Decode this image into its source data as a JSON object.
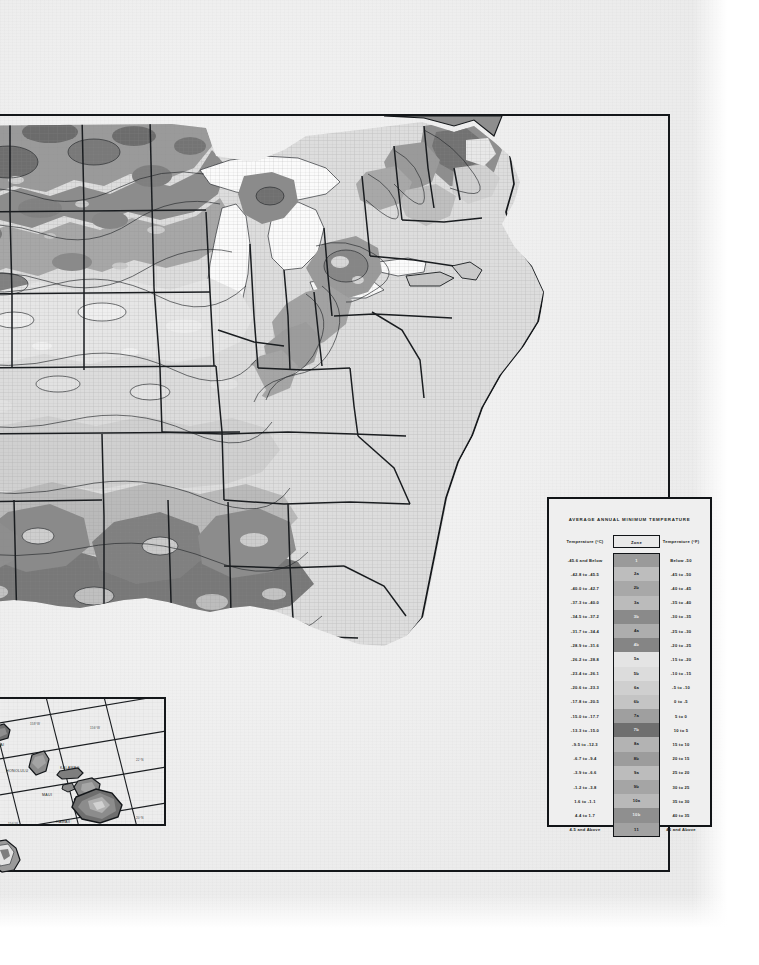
{
  "document": {
    "kind": "scanned-map-page",
    "map_title": "USDA Plant Hardiness Zone Map",
    "paper_color": "#f2f2f2",
    "ink_color": "#14171a"
  },
  "legend": {
    "title": "AVERAGE ANNUAL MINIMUM TEMPERATURE",
    "columns": {
      "celsius": "Temperature (°C)",
      "zone": "Zone",
      "fahrenheit": "Temperature (°F)"
    },
    "rows": [
      {
        "celsius": "-45.6  and Below",
        "zone": "1",
        "fahrenheit": "Below  -50",
        "swatch": "#9a9a9a",
        "dark": true
      },
      {
        "celsius": "-42.8  to  -45.5",
        "zone": "2a",
        "fahrenheit": "-45  to  -50",
        "swatch": "#bdbdbd",
        "dark": false
      },
      {
        "celsius": "-40.0  to  -42.7",
        "zone": "2b",
        "fahrenheit": "-40  to  -45",
        "swatch": "#a8a8a8",
        "dark": false
      },
      {
        "celsius": "-37.3  to  -40.0",
        "zone": "3a",
        "fahrenheit": "-35  to  -40",
        "swatch": "#bbbbbb",
        "dark": false
      },
      {
        "celsius": "-34.5  to  -37.2",
        "zone": "3b",
        "fahrenheit": "-30  to  -35",
        "swatch": "#8a8a8a",
        "dark": true
      },
      {
        "celsius": "-31.7  to  -34.4",
        "zone": "4a",
        "fahrenheit": "-25  to  -30",
        "swatch": "#adadad",
        "dark": false
      },
      {
        "celsius": "-28.9  to  -31.6",
        "zone": "4b",
        "fahrenheit": "-20  to  -25",
        "swatch": "#858585",
        "dark": true
      },
      {
        "celsius": "-26.2  to  -28.8",
        "zone": "5a",
        "fahrenheit": "-15  to  -20",
        "swatch": "#e4e4e4",
        "dark": false
      },
      {
        "celsius": "-23.4  to  -26.1",
        "zone": "5b",
        "fahrenheit": "-10  to  -15",
        "swatch": "#dcdcdc",
        "dark": false
      },
      {
        "celsius": "-20.6  to  -23.3",
        "zone": "6a",
        "fahrenheit": "-5  to  -10",
        "swatch": "#cfcfcf",
        "dark": false
      },
      {
        "celsius": "-17.8  to  -20.5",
        "zone": "6b",
        "fahrenheit": "0  to  -5",
        "swatch": "#c4c4c4",
        "dark": false
      },
      {
        "celsius": "-15.0  to  -17.7",
        "zone": "7a",
        "fahrenheit": "5  to  0",
        "swatch": "#9f9f9f",
        "dark": false
      },
      {
        "celsius": "-13.3  to  -15.0",
        "zone": "7b",
        "fahrenheit": "10  to  5",
        "swatch": "#6f6f6f",
        "dark": true
      },
      {
        "celsius": "-9.5  to  -12.3",
        "zone": "8a",
        "fahrenheit": "15  to  10",
        "swatch": "#b3b3b3",
        "dark": false
      },
      {
        "celsius": "-6.7  to  -9.4",
        "zone": "8b",
        "fahrenheit": "20  to  15",
        "swatch": "#9c9c9c",
        "dark": false
      },
      {
        "celsius": "-3.9  to  -6.6",
        "zone": "9a",
        "fahrenheit": "25  to  20",
        "swatch": "#bcbcbc",
        "dark": false
      },
      {
        "celsius": "-1.2  to  -3.8",
        "zone": "9b",
        "fahrenheit": "30  to  25",
        "swatch": "#a5a5a5",
        "dark": false
      },
      {
        "celsius": "1.6  to  -1.1",
        "zone": "10a",
        "fahrenheit": "35  to  30",
        "swatch": "#b9b9b9",
        "dark": false
      },
      {
        "celsius": "4.4  to   1.7",
        "zone": "10b",
        "fahrenheit": "40  to  35",
        "swatch": "#8f8f8f",
        "dark": true
      },
      {
        "celsius": "4.5  and Above",
        "zone": "11",
        "fahrenheit": "45  and Above",
        "swatch": "#a2a2a2",
        "dark": false
      }
    ]
  },
  "hawaii_inset": {
    "labels": [
      {
        "text": "KAUAI",
        "x": 44,
        "y": 47
      },
      {
        "text": "HONOLULU",
        "x": 60,
        "y": 72
      },
      {
        "text": "KALAWAO",
        "x": 112,
        "y": 72
      },
      {
        "text": "MAUI",
        "x": 92,
        "y": 96
      },
      {
        "text": "HAWAII",
        "x": 108,
        "y": 124
      }
    ],
    "graticule_labels": [
      {
        "text": "160°W",
        "x": 6,
        "y": 30
      },
      {
        "text": "22°N",
        "x": 163,
        "y": 65
      },
      {
        "text": "158°W",
        "x": 84,
        "y": 28
      },
      {
        "text": "20°N",
        "x": 163,
        "y": 124
      },
      {
        "text": "156°W",
        "x": 140,
        "y": 31
      },
      {
        "text": "22°N",
        "x": 4,
        "y": 86
      },
      {
        "text": "156°W",
        "x": 62,
        "y": 128
      },
      {
        "text": "154°W",
        "x": 98,
        "y": 137
      }
    ]
  }
}
